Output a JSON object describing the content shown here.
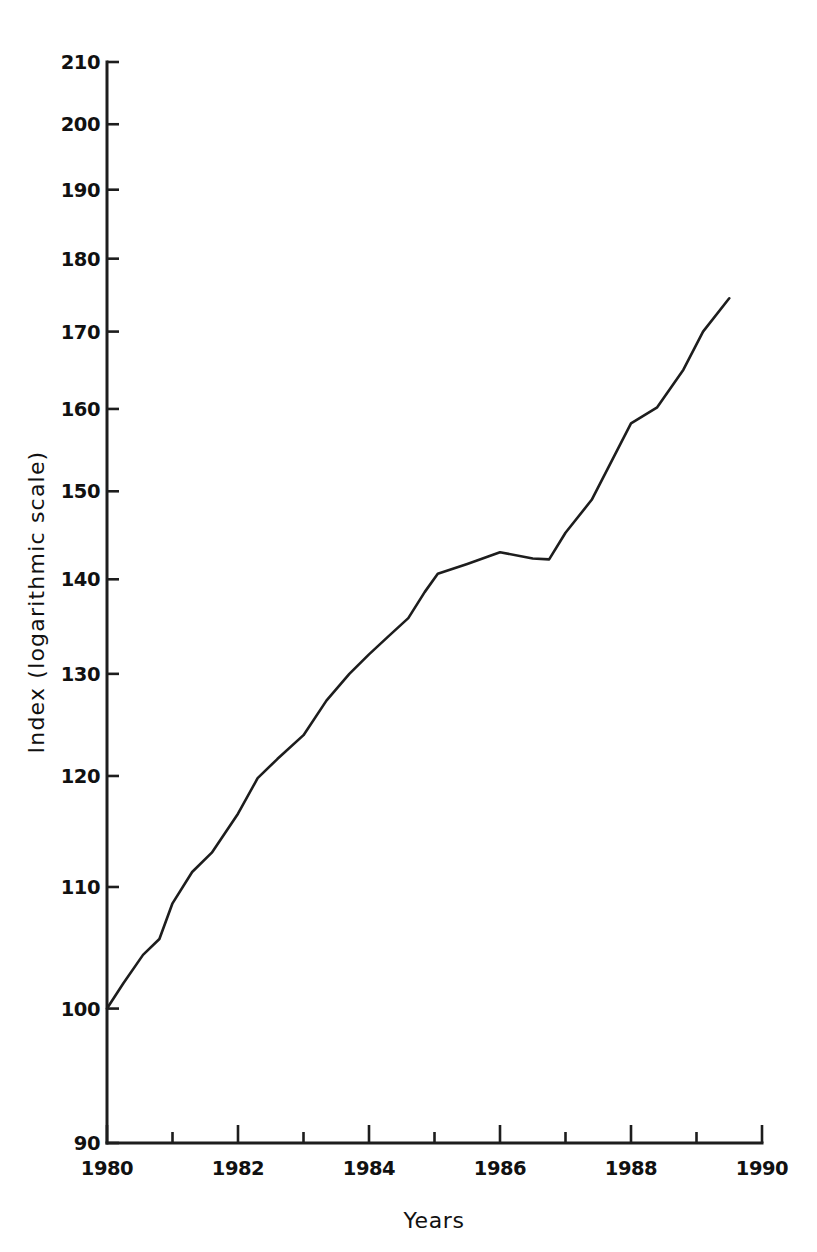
{
  "chart_data": {
    "type": "line",
    "title": "",
    "subtitle": "",
    "xlabel": "Years",
    "ylabel": "Index (logarithmic scale)",
    "yscale": "log",
    "xscale": "linear",
    "xlim": [
      1980,
      1990
    ],
    "ylim": [
      90,
      210
    ],
    "grid": false,
    "legend": null,
    "line_color": "#1d1d1d",
    "background_color": "#ffffff",
    "y_ticks": [
      90,
      100,
      110,
      120,
      130,
      140,
      150,
      160,
      170,
      180,
      190,
      200,
      210
    ],
    "y_tick_labels": [
      "90",
      "100",
      "110",
      "120",
      "130",
      "140",
      "150",
      "160",
      "170",
      "180",
      "190",
      "200",
      "210"
    ],
    "x_ticks_major": [
      1980,
      1982,
      1984,
      1986,
      1988,
      1990
    ],
    "x_tick_labels": [
      "1980",
      "1982",
      "1984",
      "1986",
      "1988",
      "1990"
    ],
    "x_ticks_minor": [
      1981,
      1983,
      1985,
      1987,
      1989
    ],
    "series": [
      {
        "name": "Index",
        "x": [
          1980.0,
          1980.25,
          1980.55,
          1980.8,
          1981.0,
          1981.3,
          1981.6,
          1982.0,
          1982.3,
          1982.6,
          1983.0,
          1983.35,
          1983.7,
          1984.0,
          1984.3,
          1984.6,
          1984.85,
          1985.05,
          1985.5,
          1986.0,
          1986.5,
          1986.75,
          1987.0,
          1987.4,
          1988.0,
          1988.4,
          1988.8,
          1989.1,
          1989.5
        ],
        "y": [
          100.0,
          102.0,
          104.3,
          105.6,
          108.6,
          111.3,
          113.0,
          116.5,
          119.8,
          121.6,
          123.9,
          127.3,
          130.0,
          132.0,
          133.9,
          135.8,
          138.6,
          140.6,
          141.7,
          143.0,
          142.3,
          142.2,
          145.2,
          149.0,
          158.2,
          160.2,
          165.0,
          170.0,
          174.5
        ]
      }
    ]
  },
  "figure": {
    "plot_left_px": 107,
    "plot_right_px": 762,
    "plot_top_px": 62,
    "plot_bottom_px": 1143,
    "x_axis_title": "Years",
    "y_axis_title": "Index (logarithmic scale)"
  }
}
